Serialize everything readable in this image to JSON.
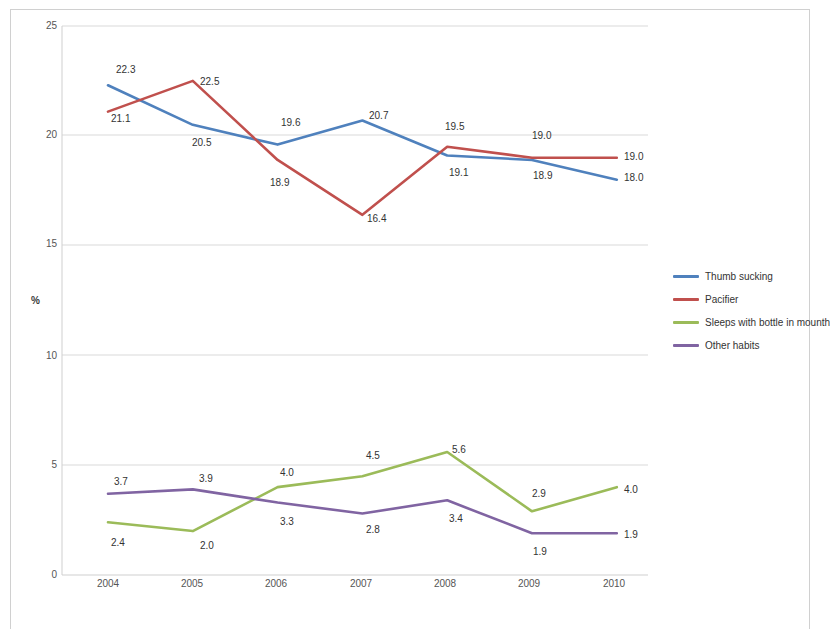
{
  "chart_data": {
    "type": "line",
    "title": "",
    "subtitle": "",
    "xlabel": "",
    "ylabel": "%",
    "categories": [
      "2004",
      "2005",
      "2006",
      "2007",
      "2008",
      "2009",
      "2010"
    ],
    "ylim": [
      0,
      25
    ],
    "yticks": [
      "0",
      "5",
      "10",
      "15",
      "20",
      "25"
    ],
    "grid": true,
    "legend_position": "right",
    "series": [
      {
        "name": "Thumb sucking",
        "color": "#4f81bd",
        "values": [
          22.3,
          20.5,
          19.6,
          20.7,
          19.1,
          18.9,
          18.0
        ],
        "labels": [
          "22.3",
          "20.5",
          "19.6",
          "20.7",
          "19.1",
          "18.9",
          "18.0"
        ]
      },
      {
        "name": "Pacifier",
        "color": "#c0504d",
        "values": [
          21.1,
          22.5,
          18.9,
          16.4,
          19.5,
          19.0,
          19.0
        ],
        "labels": [
          "21.1",
          "22.5",
          "18.9",
          "16.4",
          "19.5",
          "19.0",
          "19.0"
        ]
      },
      {
        "name": "Sleeps with bottle in mounth",
        "color": "#9bbb59",
        "values": [
          2.4,
          2.0,
          4.0,
          4.5,
          5.6,
          2.9,
          4.0
        ],
        "labels": [
          "2.4",
          "2.0",
          "4.0",
          "4.5",
          "5.6",
          "2.9",
          "4.0"
        ]
      },
      {
        "name": "Other habits",
        "color": "#8064a2",
        "values": [
          3.7,
          3.9,
          3.3,
          2.8,
          3.4,
          1.9,
          1.9
        ],
        "labels": [
          "3.7",
          "3.9",
          "3.3",
          "2.8",
          "3.4",
          "1.9",
          "1.9"
        ]
      }
    ]
  },
  "axis": {
    "y_title": "%",
    "y_ticks": [
      "25",
      "20",
      "15",
      "10",
      "5",
      "0"
    ],
    "x_ticks": [
      "2004",
      "2005",
      "2006",
      "2007",
      "2008",
      "2009",
      "2010"
    ]
  },
  "legend": {
    "items": [
      {
        "label": "Thumb sucking",
        "color": "#4f81bd"
      },
      {
        "label": "Pacifier",
        "color": "#c0504d"
      },
      {
        "label": "Sleeps with bottle in mounth",
        "color": "#9bbb59"
      },
      {
        "label": "Other habits",
        "color": "#8064a2"
      }
    ]
  },
  "data_labels": {
    "thumb_sucking": [
      {
        "text": "22.3",
        "x": 116,
        "y": 64
      },
      {
        "text": "20.5",
        "x": 192,
        "y": 137
      },
      {
        "text": "19.6",
        "x": 281,
        "y": 117
      },
      {
        "text": "20.7",
        "x": 369,
        "y": 110
      },
      {
        "text": "19.1",
        "x": 449,
        "y": 167
      },
      {
        "text": "18.9",
        "x": 533,
        "y": 170
      },
      {
        "text": "18.0",
        "x": 624,
        "y": 172
      }
    ],
    "pacifier": [
      {
        "text": "21.1",
        "x": 111,
        "y": 113
      },
      {
        "text": "22.5",
        "x": 200,
        "y": 76
      },
      {
        "text": "18.9",
        "x": 270,
        "y": 177
      },
      {
        "text": "16.4",
        "x": 367,
        "y": 213
      },
      {
        "text": "19.5",
        "x": 445,
        "y": 121
      },
      {
        "text": "19.0",
        "x": 532,
        "y": 130
      },
      {
        "text": "19.0",
        "x": 624,
        "y": 151
      }
    ],
    "bottle": [
      {
        "text": "2.4",
        "x": 111,
        "y": 537
      },
      {
        "text": "2.0",
        "x": 200,
        "y": 540
      },
      {
        "text": "4.0",
        "x": 280,
        "y": 467
      },
      {
        "text": "4.5",
        "x": 366,
        "y": 450
      },
      {
        "text": "5.6",
        "x": 452,
        "y": 444
      },
      {
        "text": "2.9",
        "x": 532,
        "y": 488
      },
      {
        "text": "4.0",
        "x": 624,
        "y": 484
      }
    ],
    "other": [
      {
        "text": "3.7",
        "x": 114,
        "y": 476
      },
      {
        "text": "3.9",
        "x": 199,
        "y": 473
      },
      {
        "text": "3.3",
        "x": 280,
        "y": 516
      },
      {
        "text": "2.8",
        "x": 366,
        "y": 524
      },
      {
        "text": "3.4",
        "x": 449,
        "y": 513
      },
      {
        "text": "1.9",
        "x": 533,
        "y": 546
      },
      {
        "text": "1.9",
        "x": 624,
        "y": 529
      }
    ]
  }
}
